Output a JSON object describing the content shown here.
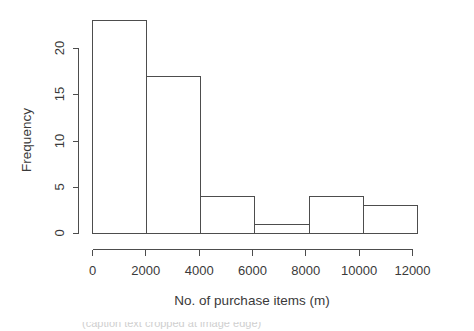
{
  "chart_data": {
    "type": "bar",
    "title": "",
    "subtitle": "",
    "xlabel": "No. of purchase items (m)",
    "ylabel": "Frequency",
    "categories": [
      "0-2030",
      "2030-4060",
      "4060-6090",
      "6090-8120",
      "8120-10150",
      "10150-12180"
    ],
    "bin_edges": [
      0,
      2030,
      4060,
      6090,
      8120,
      10150,
      12180
    ],
    "values": [
      23,
      17,
      4,
      1,
      4,
      3
    ],
    "bars": [
      {
        "label": "0-2030",
        "x0": 0,
        "x1": 2030,
        "value": 23
      },
      {
        "label": "2030-4060",
        "x0": 2030,
        "x1": 4060,
        "value": 17
      },
      {
        "label": "4060-6090",
        "x0": 4060,
        "x1": 6090,
        "value": 4
      },
      {
        "label": "6090-8120",
        "x0": 6090,
        "x1": 8120,
        "value": 1
      },
      {
        "label": "8120-10150",
        "x0": 8120,
        "x1": 10150,
        "value": 4
      },
      {
        "label": "10150-12180",
        "x0": 10150,
        "x1": 12180,
        "value": 3
      }
    ],
    "xlim": [
      -600,
      12400
    ],
    "ylim": [
      0,
      23.8
    ],
    "xticks": [
      0,
      2000,
      4000,
      6000,
      8000,
      10000,
      12000
    ],
    "xticklabels": [
      "0",
      "2000",
      "4000",
      "6000",
      "8000",
      "10000",
      "12000"
    ],
    "yticks": [
      0,
      5,
      10,
      15,
      20
    ],
    "yticklabels": [
      "0",
      "5",
      "10",
      "15",
      "20"
    ],
    "grid": false,
    "legend": null,
    "legend_position": "none",
    "colors": {
      "bar_fill": "#ffffff",
      "bar_stroke": "#4d4d4d",
      "axis": "#4d4d4d",
      "text": "#3a3a3a",
      "background": "#ffffff"
    }
  },
  "caption": {
    "partial_text": "(caption text cropped at image edge)"
  }
}
